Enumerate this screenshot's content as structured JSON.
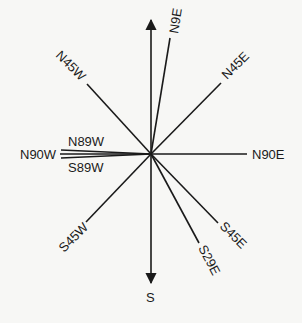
{
  "diagram": {
    "title": "",
    "center": {
      "x": 151,
      "y": 154
    },
    "axis": {
      "north_arrow": {
        "has_label": false
      },
      "south_label": "S"
    },
    "bearings": [
      {
        "id": "n9e",
        "label": "N9E"
      },
      {
        "id": "n45e",
        "label": "N45E"
      },
      {
        "id": "n90e",
        "label": "N90E"
      },
      {
        "id": "s45e",
        "label": "S45E"
      },
      {
        "id": "s29e",
        "label": "S29E"
      },
      {
        "id": "s45w",
        "label": "S45W"
      },
      {
        "id": "s89w",
        "label": "S89W"
      },
      {
        "id": "n90w",
        "label": "N90W"
      },
      {
        "id": "n89w",
        "label": "N89W"
      },
      {
        "id": "n45w",
        "label": "N45W"
      }
    ],
    "colors": {
      "line": "#1a1a1a",
      "background": "#f7f7f5"
    }
  }
}
